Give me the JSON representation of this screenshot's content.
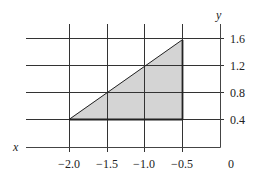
{
  "diagram": {
    "axes": {
      "x_label": "x",
      "y_label": "y",
      "origin_label": "0"
    },
    "x_ticks": [
      "−2.0",
      "−1.5",
      "−1.0",
      "−0.5"
    ],
    "y_ticks": [
      "1.6",
      "1.2",
      "0.8",
      "0.4"
    ],
    "region": {
      "shape": "triangle",
      "vertices": [
        [
          -2.0,
          0.4
        ],
        [
          -0.5,
          1.6
        ],
        [
          -0.5,
          0.4
        ]
      ],
      "fill_color": "#d4d4d4",
      "stroke_color": "#222222"
    },
    "grid_color": "#333333"
  }
}
